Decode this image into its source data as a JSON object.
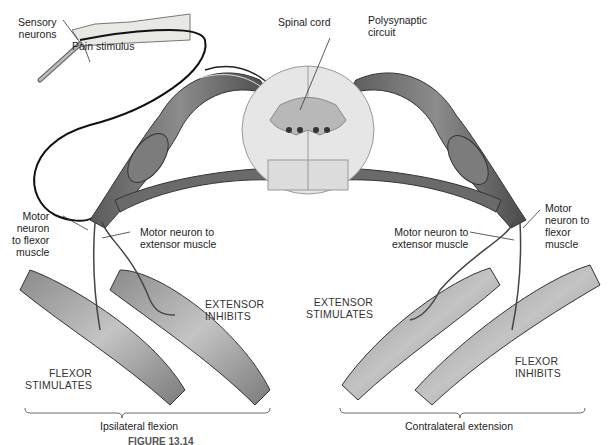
{
  "figure": {
    "caption": "FIGURE 13.14"
  },
  "labels": {
    "sensory_neurons": "Sensory\nneurons",
    "pain_stimulus": "Pain stimulus",
    "spinal_cord": "Spinal cord",
    "polysynaptic_circuit": "Polysynaptic\ncircuit",
    "left_motor_flexor": "Motor\nneuron\nto flexor\nmuscle",
    "left_motor_extensor": "Motor neuron to\nextensor muscle",
    "right_motor_extensor": "Motor neuron to\nextensor muscle",
    "right_motor_flexor": "Motor\nneuron to\nflexor\nmuscle",
    "left_extensor_state": "EXTENSOR\nINHIBITS",
    "left_flexor_state": "FLEXOR\nSTIMULATES",
    "right_extensor_state": "EXTENSOR\nSTIMULATES",
    "right_flexor_state": "FLEXOR\nINHIBITS",
    "ipsilateral": "Ipsilateral flexion",
    "contralateral": "Contralateral extension"
  },
  "colors": {
    "nerve_dark": "#3a3a3a",
    "nerve_mid": "#6e6e6e",
    "cord_fill": "#e6e6e6",
    "grey_matter": "#b8b8b8",
    "skin": "#e8e8e4",
    "muscle_light": "#b0b0b0"
  }
}
